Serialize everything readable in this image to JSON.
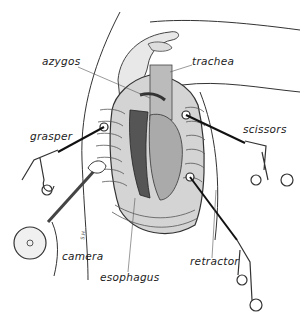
{
  "figure": {
    "labels": {
      "azygos": "azygos",
      "trachea": "trachea",
      "grasper": "grasper",
      "scissors": "scissors",
      "camera": "camera",
      "esophagus": "esophagus",
      "retractor": "retractor"
    },
    "artist_signature": "S.H."
  }
}
